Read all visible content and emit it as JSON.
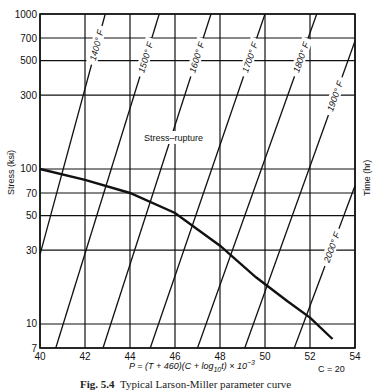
{
  "chart_data": {
    "type": "line",
    "title": "",
    "xlabel": "P = (T + 460)(C + log10 t) × 10^-3",
    "ylabel": "Stress (ksi)",
    "y2label": "Time (hr)",
    "constant_label": "C = 20",
    "xlim": [
      40,
      54
    ],
    "ylim": [
      7,
      1000
    ],
    "yscale": "log",
    "grid": true,
    "x_ticks": [
      40,
      42,
      44,
      46,
      48,
      50,
      52,
      54
    ],
    "y_ticks": [
      7,
      10,
      30,
      50,
      70,
      100,
      300,
      500,
      700,
      1000
    ],
    "series": [
      {
        "name": "Stress-rupture",
        "x": [
          40,
          42,
          44,
          46,
          48,
          49.6,
          51,
          52,
          53
        ],
        "values": [
          100,
          85,
          70,
          52,
          32,
          20,
          14,
          11,
          8
        ]
      }
    ],
    "isotherms": [
      {
        "label": "1400° F",
        "from": [
          40,
          28
        ],
        "to": [
          42.9,
          1000
        ]
      },
      {
        "label": "1500° F",
        "from": [
          40.7,
          7
        ],
        "to": [
          45.3,
          1000
        ]
      },
      {
        "label": "1600° F",
        "from": [
          42.8,
          7
        ],
        "to": [
          47.6,
          1000
        ]
      },
      {
        "label": "1700° F",
        "from": [
          44.9,
          7
        ],
        "to": [
          50.0,
          1000
        ]
      },
      {
        "label": "1800° F",
        "from": [
          47.0,
          7
        ],
        "to": [
          52.3,
          1000
        ]
      },
      {
        "label": "1900° F",
        "from": [
          49.1,
          7
        ],
        "to": [
          54,
          670
        ]
      },
      {
        "label": "2000° F",
        "from": [
          51.3,
          7
        ],
        "to": [
          54,
          78
        ]
      }
    ],
    "annotations": [
      "Stress–rupture",
      "C = 20"
    ]
  },
  "labels": {
    "stress_rupture": "Stress–rupture",
    "y_axis": "Stress  (ksi)",
    "y2_axis": "Time  (hr)",
    "x_formula": "P = (T + 460)(C + log",
    "x_formula_sub": "10",
    "x_formula_tail": "t)  ×  10",
    "x_formula_exp": "−3",
    "constant": "C = 20",
    "caption_fig": "Fig. 5.4",
    "caption_text": "Typical Larson-Miller parameter curve"
  },
  "colors": {
    "ink": "#111111",
    "paper": "#ffffff"
  }
}
